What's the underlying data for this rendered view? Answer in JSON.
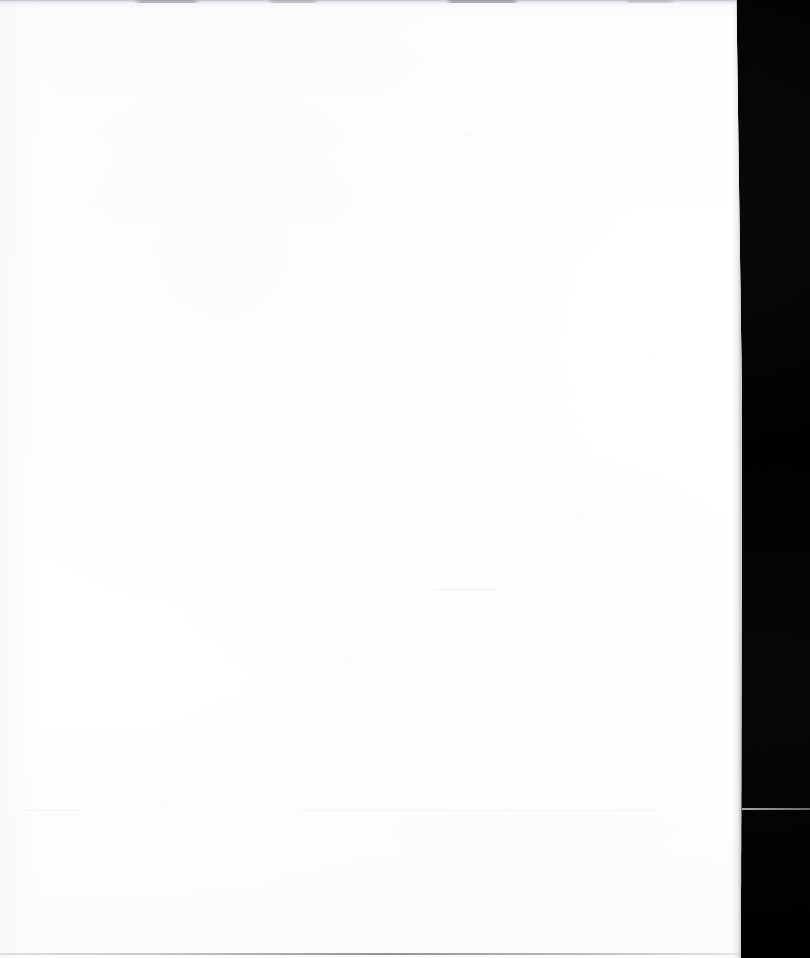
{
  "document": {
    "kind": "scanned-page",
    "title": "Blank scanned page",
    "page_text": "",
    "visible_text_lines": [],
    "orientation": "portrait",
    "width_px": 810,
    "height_px": 958
  },
  "regions": {
    "page_sheet": {
      "name": "white paper sheet",
      "left_px": 0,
      "top_px": 0,
      "width_px": 742,
      "height_px": 958,
      "color": "#ffffff"
    },
    "scanner_backdrop": {
      "name": "black scanner background",
      "left_px": 738,
      "top_px": 0,
      "width_px": 72,
      "height_px": 958,
      "color": "#010101"
    }
  },
  "marks": {
    "top_shadow": {
      "name": "scan shadow band along top edge",
      "top_px": 0,
      "height_px": 4,
      "color": "#96989c"
    },
    "bottom_edge_line": {
      "name": "paper edge hairline near bottom",
      "top_px": 952,
      "height_px": 2,
      "color": "#76787c"
    },
    "light_rule": {
      "name": "light horizontal rule across black field",
      "left_px": 742,
      "top_px": 808,
      "width_px": 68,
      "height_px": 2,
      "color": "#9a9a9a"
    }
  },
  "colors": {
    "paper_white": "#ffffff",
    "paper_tint": "#fcfcfd",
    "backdrop_black": "#010101",
    "shadow_gray": "#96989c",
    "rule_gray": "#9a9a9a",
    "edge_gray": "#76787c"
  }
}
